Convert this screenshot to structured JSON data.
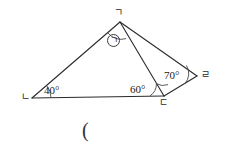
{
  "figure": {
    "type": "geometry-diagram",
    "background_color": "#ffffff",
    "stroke_color": "#2b2b2b",
    "vertices": [
      {
        "id": "g",
        "label": "ㄱ",
        "x": 120,
        "y": 22
      },
      {
        "id": "n",
        "label": "ㄴ",
        "x": 32,
        "y": 98
      },
      {
        "id": "d",
        "label": "ㄷ",
        "x": 164,
        "y": 96
      },
      {
        "id": "r",
        "label": "ㄹ",
        "x": 197,
        "y": 76
      }
    ],
    "segments": [
      {
        "from": "n",
        "to": "g"
      },
      {
        "from": "g",
        "to": "d"
      },
      {
        "from": "n",
        "to": "d"
      },
      {
        "from": "g",
        "to": "r"
      },
      {
        "from": "d",
        "to": "r"
      }
    ],
    "angles": [
      {
        "id": "angle-n",
        "at": "n",
        "label": "40°",
        "value": 40,
        "unit": "degree"
      },
      {
        "id": "angle-d",
        "at": "d",
        "label": "60°",
        "value": 60,
        "unit": "degree"
      },
      {
        "id": "angle-r",
        "at": "r",
        "label": "70°",
        "value": 70,
        "unit": "degree"
      },
      {
        "id": "angle-g",
        "at": "g",
        "label": "㉠",
        "value": null,
        "unit": "unknown"
      }
    ],
    "unknown_marker": {
      "glyph": "ㄱ",
      "circled": true,
      "name": "circled-giyeok"
    },
    "caption": "("
  }
}
